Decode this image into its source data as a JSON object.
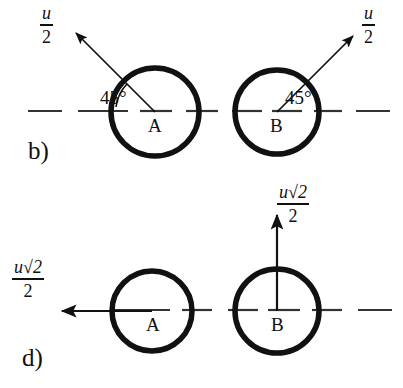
{
  "figure": {
    "ink_color": "#111111",
    "background_color": "#ffffff",
    "axis_style": "dash-dot"
  },
  "panels": [
    {
      "id": "panel-b",
      "label": "b)",
      "axis_y": 111,
      "bodies": [
        {
          "id": "A",
          "label": "A",
          "cx": 155,
          "cy": 112,
          "r": 44
        },
        {
          "id": "B",
          "label": "B",
          "cx": 277,
          "cy": 112,
          "r": 42
        }
      ],
      "vectors": [
        {
          "id": "vector-a",
          "from_body": "A",
          "direction_deg": 135,
          "magnitude_text": "u/2",
          "numerator": "u",
          "denominator": "2",
          "label_x": 40,
          "label_y": 4
        },
        {
          "id": "vector-b",
          "from_body": "B",
          "direction_deg": 45,
          "magnitude_text": "u/2",
          "numerator": "u",
          "denominator": "2",
          "label_x": 362,
          "label_y": 4
        }
      ],
      "angles": [
        {
          "id": "angle-a",
          "value": "45°",
          "body": "A",
          "x": 100,
          "y": 88
        },
        {
          "id": "angle-b",
          "value": "45°",
          "body": "B",
          "x": 285,
          "y": 88
        }
      ]
    },
    {
      "id": "panel-d",
      "label": "d)",
      "axis_y": 310,
      "bodies": [
        {
          "id": "A",
          "label": "A",
          "cx": 152,
          "cy": 311,
          "r": 40
        },
        {
          "id": "B",
          "label": "B",
          "cx": 277,
          "cy": 311,
          "r": 42
        }
      ],
      "vectors": [
        {
          "id": "vector-a",
          "from_body": "A",
          "direction_deg": 180,
          "magnitude_text": "u√2/2",
          "numerator": "u√2",
          "denominator": "2",
          "label_x": 12,
          "label_y": 258
        },
        {
          "id": "vector-b",
          "from_body": "B",
          "direction_deg": 90,
          "magnitude_text": "u√2/2",
          "numerator": "u√2",
          "denominator": "2",
          "label_x": 277,
          "label_y": 183
        }
      ],
      "angles": []
    }
  ],
  "symbols": {
    "u": "u",
    "two": "2",
    "sqrt_two": "√2",
    "degree_45": "45°",
    "body_a": "A",
    "body_b": "B",
    "panel_b": "b)",
    "panel_d": "d)"
  }
}
